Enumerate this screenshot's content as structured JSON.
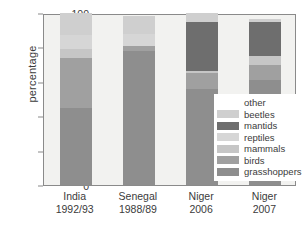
{
  "chart_data": {
    "type": "bar",
    "subtype": "stacked-bar-percentage",
    "title": "",
    "xlabel": "",
    "ylabel": "percentage",
    "ylim": [
      0,
      100
    ],
    "yticks": [
      0,
      20,
      40,
      60,
      80,
      100
    ],
    "ytick_labels": [
      "0",
      "20",
      "40",
      "60",
      "80",
      "100"
    ],
    "grid": false,
    "legend_position": "right-inside",
    "categories": [
      "India\n1992/93",
      "Senegal\n1988/89",
      "Niger\n2006",
      "Niger\n2007"
    ],
    "category_labels": [
      {
        "line1": "India",
        "line2": "1992/93"
      },
      {
        "line1": "Senegal",
        "line2": "1988/89"
      },
      {
        "line1": "Niger",
        "line2": "2006"
      },
      {
        "line1": "Niger",
        "line2": "2007"
      }
    ],
    "series": [
      {
        "name": "grasshoppers",
        "color": "#8e8e8e",
        "values": [
          45,
          78,
          56,
          61
        ]
      },
      {
        "name": "birds",
        "color": "#a0a0a0",
        "values": [
          29,
          3,
          9,
          9
        ]
      },
      {
        "name": "mammals",
        "color": "#c6c6c6",
        "values": [
          5,
          0,
          1,
          5
        ]
      },
      {
        "name": "reptiles",
        "color": "#d6d6d6",
        "values": [
          8,
          7,
          0,
          0
        ]
      },
      {
        "name": "mantids",
        "color": "#6e6e6e",
        "values": [
          0,
          0,
          29,
          20
        ]
      },
      {
        "name": "beetles",
        "color": "#cfcfcf",
        "values": [
          13,
          10,
          5,
          1.5
        ]
      },
      {
        "name": "other",
        "color": "#ffffff",
        "values": [
          0,
          0,
          0,
          0
        ]
      }
    ],
    "legend_entries": [
      {
        "label": "other",
        "color": "#ffffff"
      },
      {
        "label": "beetles",
        "color": "#cfcfcf"
      },
      {
        "label": "mantids",
        "color": "#6e6e6e"
      },
      {
        "label": "reptiles",
        "color": "#d6d6d6"
      },
      {
        "label": "mammals",
        "color": "#c6c6c6"
      },
      {
        "label": "birds",
        "color": "#a0a0a0"
      },
      {
        "label": "grasshoppers",
        "color": "#8e8e8e"
      }
    ],
    "stack_order_bottom_to_top": [
      "grasshoppers",
      "birds",
      "mammals",
      "reptiles",
      "mantids",
      "beetles",
      "other"
    ],
    "panel_background": "#f2f2f0",
    "axis_color": "#8a8a8a",
    "text_color": "#3b3b3b"
  }
}
